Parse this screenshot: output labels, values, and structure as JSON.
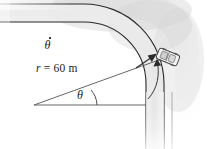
{
  "figure": {
    "type": "mechanics-diagram",
    "width": 217,
    "height": 149,
    "background_color": "#ffffff"
  },
  "labels": {
    "radius": {
      "variable": "r",
      "equals": " = ",
      "value": "60",
      "unit": "m",
      "full_text": "r = 60 m"
    },
    "angle": {
      "symbol": "θ",
      "name": "theta"
    },
    "angular_rate": {
      "symbol": "θ",
      "overdot": true,
      "name": "theta-dot",
      "full_text": "θ̇"
    }
  },
  "geometry": {
    "inner_radius_px": 58,
    "outer_radius_px": 76,
    "center_x_px": 84,
    "center_y_px": 20,
    "vertex_x_px": 34,
    "vertex_y_px": 105,
    "theta_degrees": 36,
    "road_orientation_start": "horizontal-left",
    "road_orientation_end": "vertical-down"
  },
  "elements": {
    "road_name": "curved-road",
    "vehicle_name": "car",
    "radius_line_name": "radius-line",
    "baseline_name": "angle-baseline",
    "arc_arrow_name": "angular-velocity-arrow",
    "vector_arrow_name": "theta-dot-vector-arrow"
  },
  "colors": {
    "line": "#2b2b2b",
    "road_fill": "#e9e9e9",
    "shade_light": "#f4f4f4",
    "shade_mid": "#e2e2e2",
    "text": "#1a1a1a",
    "car_body": "#f2f2f2",
    "car_outline": "#4a4a4a"
  }
}
